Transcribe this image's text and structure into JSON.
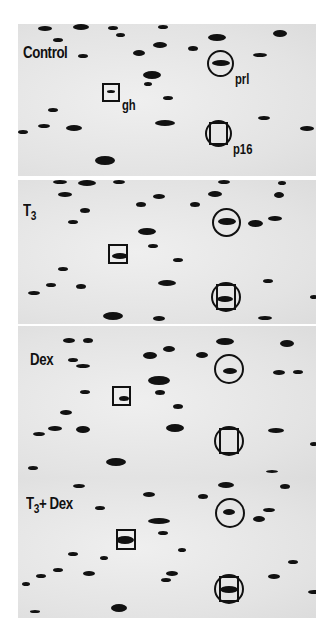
{
  "figure": {
    "type": "2D gel electrophoresis autoradiograms",
    "panels": [
      {
        "label": "Control",
        "label_sub": "",
        "annotations": [
          "gh",
          "prl",
          "p16"
        ]
      },
      {
        "label": "T",
        "label_sub": "3",
        "annotations": []
      },
      {
        "label": "Dex",
        "label_sub": "",
        "annotations": []
      },
      {
        "label": "T",
        "label_sub": "3",
        "label_suffix": "+ Dex",
        "annotations": []
      }
    ],
    "markers": {
      "square": "gh (growth hormone)",
      "circle_top": "prl",
      "circle_square_bottom": "p16"
    }
  }
}
